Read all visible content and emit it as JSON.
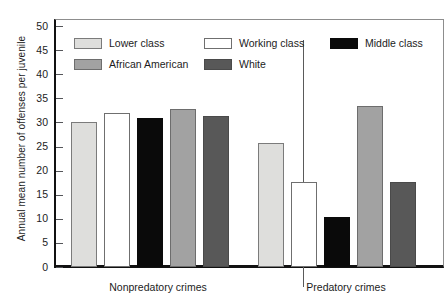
{
  "chart_data": {
    "type": "bar",
    "title": "",
    "subtitle": "",
    "xlabel": "",
    "ylabel": "Annual mean number of offenses per juvenile",
    "categories": [
      "Nonpredatory crimes",
      "Predatory crimes"
    ],
    "ylim": [
      0,
      50
    ],
    "yticks": [
      0,
      5,
      10,
      15,
      20,
      25,
      30,
      35,
      40,
      45,
      50
    ],
    "ytick_labels": [
      "0",
      "5",
      "10",
      "15",
      "20",
      "25",
      "30",
      "35",
      "40",
      "45",
      "50"
    ],
    "grid": false,
    "legend_position": "inside-top-left",
    "series": [
      {
        "name": "Lower class",
        "color": "#dededc",
        "values": [
          30.0,
          25.7
        ]
      },
      {
        "name": "Working class",
        "color": "#ffffff",
        "values": [
          31.9,
          17.7
        ]
      },
      {
        "name": "Middle class",
        "color": "#0a0a0a",
        "values": [
          31.0,
          10.3
        ]
      },
      {
        "name": "African American",
        "color": "#a2a2a2",
        "values": [
          32.8,
          33.4
        ]
      },
      {
        "name": "White",
        "color": "#585858",
        "values": [
          31.3,
          17.7
        ]
      }
    ],
    "annotations": []
  },
  "legend": {
    "items": [
      {
        "label": "Lower class",
        "swatch": "lower-class"
      },
      {
        "label": "Working class",
        "swatch": "working-class"
      },
      {
        "label": "Middle class",
        "swatch": "middle-class"
      },
      {
        "label": "African American",
        "swatch": "african-american"
      },
      {
        "label": "White",
        "swatch": "white"
      }
    ]
  },
  "axes": {
    "y_title": "Annual mean number of offenses per juvenile",
    "x_categories": [
      "Nonpredatory crimes",
      "Predatory crimes"
    ]
  }
}
